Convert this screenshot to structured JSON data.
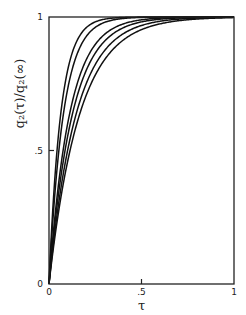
{
  "chart_data": {
    "type": "line",
    "title": "",
    "xlabel": "τ",
    "ylabel": "q₂(τ)/q₂(∞)",
    "xlim": [
      0,
      1
    ],
    "ylim": [
      0,
      1
    ],
    "xticks": [
      {
        "value": 0,
        "label": "0"
      },
      {
        "value": 0.5,
        "label": ".5"
      },
      {
        "value": 1,
        "label": "1"
      }
    ],
    "yticks": [
      {
        "value": 0,
        "label": "0"
      },
      {
        "value": 0.5,
        "label": ".5"
      },
      {
        "value": 1,
        "label": "1"
      }
    ],
    "grid": false,
    "legend": null,
    "model": "1 - exp(-k·τ) (approximate fit)",
    "series": [
      {
        "name": "curve-1",
        "k": 16.0,
        "half_tau": 0.043
      },
      {
        "name": "curve-2",
        "k": 13.0,
        "half_tau": 0.054
      },
      {
        "name": "curve-3",
        "k": 9.1,
        "half_tau": 0.076
      },
      {
        "name": "curve-4",
        "k": 8.0,
        "half_tau": 0.086
      },
      {
        "name": "curve-5",
        "k": 6.9,
        "half_tau": 0.1
      },
      {
        "name": "curve-6",
        "k": 6.1,
        "half_tau": 0.114
      }
    ]
  },
  "layout": {
    "plot": {
      "left": 49,
      "top": 17,
      "right": 234,
      "bottom": 284
    }
  }
}
